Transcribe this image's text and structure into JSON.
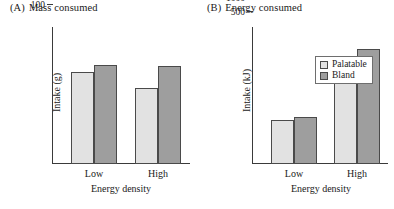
{
  "chart_data": [
    {
      "type": "bar",
      "panel_tag": "(A)",
      "title": "Mass consumed",
      "categories": [
        "Low",
        "High"
      ],
      "series": [
        {
          "name": "Palatable",
          "values": [
            415,
            342
          ],
          "color": "#e2e2e2"
        },
        {
          "name": "Bland",
          "values": [
            447,
            443
          ],
          "color": "#9e9e9e"
        }
      ],
      "xlabel": "Energy density",
      "ylabel": "Intake (g)",
      "ylim": [
        0,
        620
      ],
      "yticks": [
        100,
        200,
        300,
        400,
        500,
        600
      ],
      "ytick_labels": [
        "100",
        "200",
        "300",
        "400",
        "500",
        "600"
      ],
      "grid": false,
      "legend": false
    },
    {
      "type": "bar",
      "panel_tag": "(B)",
      "title": "Energy consumed",
      "categories": [
        "Low",
        "High"
      ],
      "series": [
        {
          "name": "Palatable",
          "values": [
            1490,
            2900
          ],
          "color": "#e2e2e2"
        },
        {
          "name": "Bland",
          "values": [
            1600,
            3900
          ],
          "color": "#9e9e9e"
        }
      ],
      "xlabel": "Energy density",
      "ylabel": "Intake (kJ)",
      "ylim": [
        0,
        4650
      ],
      "yticks": [
        500,
        1000,
        1500,
        2000,
        2500,
        3000,
        3500,
        4000,
        4500
      ],
      "ytick_labels": [
        "500",
        "1000",
        "1500",
        "2000",
        "2500",
        "3000",
        "3500",
        "4000",
        "4500"
      ],
      "grid": false,
      "legend": true,
      "legend_position": "top-left",
      "legend_entries": [
        "Palatable",
        "Bland"
      ]
    }
  ]
}
